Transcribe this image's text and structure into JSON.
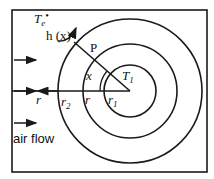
{
  "diagram": {
    "labels": {
      "te": "T",
      "te_sub": "e",
      "te_mark": "•",
      "hx": "h (x)",
      "p": "P",
      "x": "x",
      "t1": "T",
      "t1_sub": "1",
      "r_left": "r",
      "r2": "r",
      "r2_sub": "2",
      "r_mid": "r",
      "r1": "r",
      "r1_sub": "1",
      "airflow": "air flow"
    },
    "geometry": {
      "center": [
        130,
        91
      ],
      "radii": [
        26,
        47,
        72
      ],
      "box": [
        12,
        10,
        207,
        172
      ]
    },
    "colors": {
      "stroke": "#1a1a1a",
      "background": "#ffffff"
    }
  }
}
